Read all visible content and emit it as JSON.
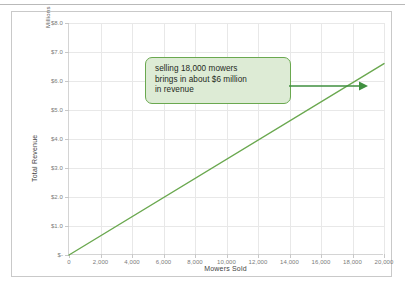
{
  "chart_data": {
    "type": "line",
    "title": "",
    "xlabel": "Mowers Sold",
    "ylabel": "Total Revenue",
    "y_unit_label": "Millions",
    "xlim": [
      0,
      20000
    ],
    "ylim": [
      0,
      8000000
    ],
    "grid": true,
    "legend": "none",
    "x_ticks": [
      0,
      2000,
      4000,
      6000,
      8000,
      10000,
      12000,
      14000,
      16000,
      18000,
      20000
    ],
    "x_tick_labels": [
      "0",
      "2,000",
      "4,000",
      "6,000",
      "8,000",
      "10,000",
      "12,000",
      "14,000",
      "16,000",
      "18,000",
      "20,000"
    ],
    "y_ticks": [
      0,
      1000000,
      2000000,
      3000000,
      4000000,
      5000000,
      6000000,
      7000000,
      8000000
    ],
    "y_tick_labels": [
      "$-",
      "$1.0",
      "$2.0",
      "$3.0",
      "$4.0",
      "$5.0",
      "$6.0",
      "$7.0",
      "$8.0"
    ],
    "series": [
      {
        "name": "Total Revenue",
        "color": "#6aa84f",
        "x": [
          0,
          20000
        ],
        "values": [
          0,
          6600000
        ]
      }
    ],
    "annotations": [
      {
        "type": "callout",
        "lines": [
          "selling 18,000 mowers",
          "brings in about $6 million",
          "in revenue"
        ],
        "fill": "#ddebd5",
        "border": "#6aa84f",
        "arrow_to_x": 18000,
        "arrow_to_y": 6000000
      }
    ]
  },
  "colors": {
    "line": "#6aa84f",
    "callout_fill": "#ddebd5",
    "callout_border": "#6aa84f",
    "grid": "#e8e8e8",
    "axis": "#d4d4d4",
    "tick_text": "#7b7b7b",
    "axis_title": "#3f3f3f",
    "card_border": "#c9c9c9"
  }
}
